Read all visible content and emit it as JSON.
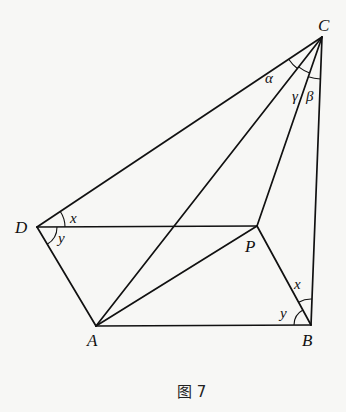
{
  "figure": {
    "caption": "图 7",
    "points": {
      "A": {
        "label": "A",
        "x": 96,
        "y": 326
      },
      "B": {
        "label": "B",
        "x": 311,
        "y": 325
      },
      "C": {
        "label": "C",
        "x": 322,
        "y": 37
      },
      "D": {
        "label": "D",
        "x": 37,
        "y": 227
      },
      "P": {
        "label": "P",
        "x": 257,
        "y": 226
      }
    },
    "segments": [
      "DC",
      "DP",
      "DA",
      "AB",
      "AP",
      "AC",
      "PC",
      "PB",
      "BC"
    ],
    "angles": {
      "D_upper": {
        "label": "x",
        "between": "DC-DP"
      },
      "D_lower": {
        "label": "y",
        "between": "DP-DA"
      },
      "B_upper": {
        "label": "x",
        "between": "BC-BP"
      },
      "B_lower": {
        "label": "y",
        "between": "BP-BA"
      },
      "C_alpha": {
        "label": "α",
        "between": "CD-CA"
      },
      "C_gamma": {
        "label": "γ",
        "between": "CA-CP"
      },
      "C_beta": {
        "label": "β",
        "between": "CP-CB"
      }
    }
  }
}
